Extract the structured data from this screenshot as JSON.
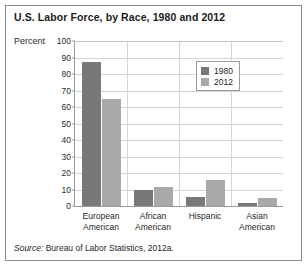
{
  "chart_data": {
    "type": "bar",
    "title": "U.S. Labor Force, by Race, 1980 and 2012",
    "xlabel": "",
    "ylabel": "Percent",
    "ylim": [
      0,
      100
    ],
    "ytick_step": 10,
    "yticks": [
      100,
      90,
      80,
      70,
      60,
      50,
      40,
      30,
      20,
      10,
      0
    ],
    "grid": true,
    "legend_position": "upper-right-inside",
    "categories": [
      "European American",
      "African American",
      "Hispanic",
      "Asian American"
    ],
    "category_lines": [
      [
        "European",
        "American"
      ],
      [
        "African",
        "American"
      ],
      [
        "Hispanic",
        ""
      ],
      [
        "Asian",
        "American"
      ]
    ],
    "series": [
      {
        "name": "1980",
        "color": "#787878",
        "values": [
          87.5,
          10,
          5.5,
          2
        ]
      },
      {
        "name": "2012",
        "color": "#a9a9a9",
        "values": [
          65,
          11.5,
          15.5,
          5
        ]
      }
    ]
  },
  "legend": {
    "items": [
      {
        "label": "1980"
      },
      {
        "label": "2012"
      }
    ]
  },
  "source": {
    "keyword": "Source:",
    "text": "Bureau of Labor Statistics, 2012a."
  }
}
